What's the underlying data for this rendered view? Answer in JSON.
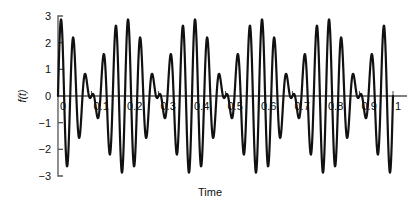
{
  "chart_data": {
    "type": "line",
    "title": "",
    "xlabel": "Time",
    "ylabel": "f(t)",
    "xlim": [
      0,
      1
    ],
    "ylim": [
      -3,
      3
    ],
    "grid": false,
    "legend": null,
    "x_ticks": [
      0,
      0.1,
      0.2,
      0.3,
      0.4,
      0.5,
      0.6,
      0.7,
      0.8,
      0.9,
      1
    ],
    "x_tick_labels": [
      "0",
      "0.1",
      "0.2",
      "0.3",
      "0.4",
      "0.5",
      "0.6",
      "0.7",
      "0.8",
      "0.9",
      "1"
    ],
    "y_ticks": [
      -3,
      -2,
      -1,
      0,
      1,
      2,
      3
    ],
    "y_tick_labels": [
      "-3",
      "-2",
      "-1",
      "0",
      "1",
      "2",
      "3"
    ],
    "line_color": "#111111",
    "line_width": 2.2,
    "axis_color": "#555555",
    "series": [
      {
        "name": "f(t)",
        "model": "sum_of_sines",
        "components": [
          {
            "amplitude": 1.5,
            "frequency_hz": 25,
            "phase_rad": 0
          },
          {
            "amplitude": 1.4,
            "frequency_hz": 30,
            "phase_rad": 0
          }
        ],
        "peak_max": 2.9,
        "peak_min": -2.9,
        "secondary_peak_max": 1.9,
        "secondary_peak_min": -1.9,
        "beat_period": 0.2,
        "value_at_t0": 0.0,
        "n_samples": 2000
      }
    ]
  }
}
